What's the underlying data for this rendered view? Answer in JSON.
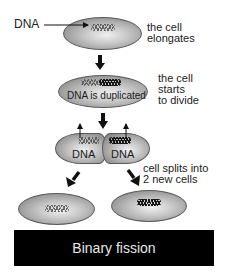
{
  "diagram": {
    "title": "Binary fission",
    "dna_pointer_label": "DNA",
    "steps": [
      {
        "id": "elongate",
        "caption": "the cell\nelongates",
        "cell_text": ""
      },
      {
        "id": "duplicate",
        "caption": "the cell\nstarts\nto divide",
        "cell_text": "DNA is duplicated"
      },
      {
        "id": "divide",
        "caption": "",
        "cell_text_left": "DNA",
        "cell_text_right": "DNA"
      },
      {
        "id": "split",
        "caption": "cell splits into\n2 new cells"
      }
    ],
    "colors": {
      "banner_bg": "#000000",
      "banner_text": "#e8e8e8",
      "cell_edge": "#6e6e6e",
      "cell_center": "#f0f0f0",
      "arrow": "#111111"
    },
    "icons": [
      "arrow-right-icon",
      "arrow-down-icon",
      "arrow-up-icon",
      "arrow-diagonal-icon"
    ]
  }
}
